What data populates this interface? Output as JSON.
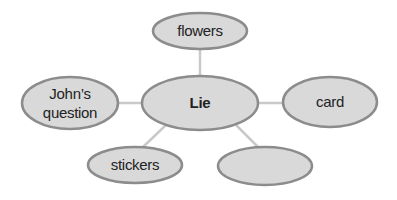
{
  "diagram": {
    "type": "mind-map",
    "colors": {
      "node_fill": "#d9d9d9",
      "node_stroke": "#8c8c8c",
      "connector": "#c9c9c9",
      "text": "#222222",
      "background": "#ffffff"
    },
    "center": {
      "id": "lie",
      "label": "Lie",
      "cx": 200,
      "cy": 103,
      "rx": 58,
      "ry": 27
    },
    "nodes": [
      {
        "id": "flowers",
        "lines": [
          "flowers"
        ],
        "cx": 200,
        "cy": 31,
        "rx": 47,
        "ry": 18
      },
      {
        "id": "johns-question",
        "lines": [
          "John’s",
          "question"
        ],
        "cx": 70,
        "cy": 103,
        "rx": 48,
        "ry": 26
      },
      {
        "id": "card",
        "lines": [
          "card"
        ],
        "cx": 330,
        "cy": 102,
        "rx": 47,
        "ry": 25
      },
      {
        "id": "stickers",
        "lines": [
          "stickers"
        ],
        "cx": 135,
        "cy": 165,
        "rx": 47,
        "ry": 18
      },
      {
        "id": "empty",
        "lines": [
          ""
        ],
        "cx": 265,
        "cy": 166,
        "rx": 47,
        "ry": 19
      }
    ],
    "edges": [
      {
        "from": "lie",
        "to": "flowers",
        "x1": 200,
        "y1": 76,
        "x2": 200,
        "y2": 49
      },
      {
        "from": "lie",
        "to": "johns-question",
        "x1": 142,
        "y1": 103,
        "x2": 118,
        "y2": 103
      },
      {
        "from": "lie",
        "to": "card",
        "x1": 258,
        "y1": 103,
        "x2": 283,
        "y2": 103
      },
      {
        "from": "lie",
        "to": "stickers",
        "x1": 166,
        "y1": 125,
        "x2": 143,
        "y2": 147
      },
      {
        "from": "lie",
        "to": "empty",
        "x1": 236,
        "y1": 125,
        "x2": 259,
        "y2": 148
      }
    ]
  }
}
